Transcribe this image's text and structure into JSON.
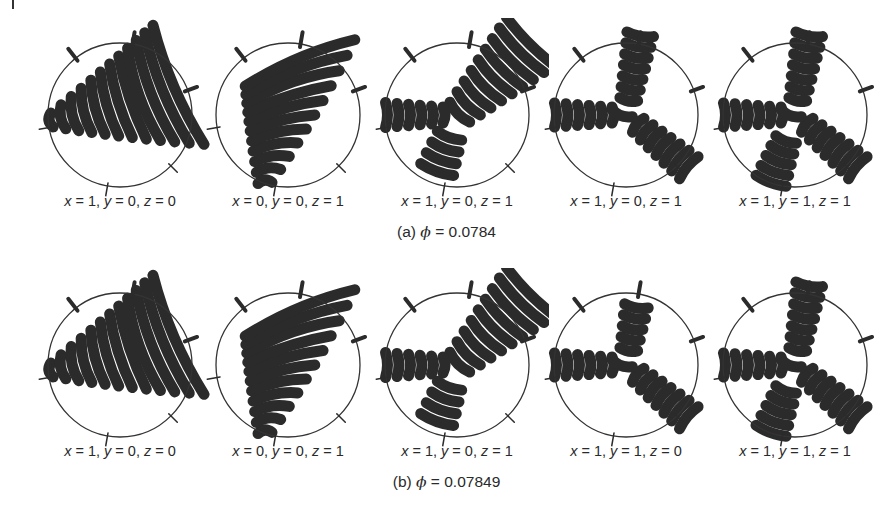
{
  "figure": {
    "rows": [
      {
        "caption_prefix": "(a)",
        "caption_symbol": "ϕ",
        "caption_value": "= 0.0784",
        "panels": [
          {
            "label": "x = 1, y = 0, z = 0",
            "pattern": "single-arm-right",
            "x_val": "1",
            "y_val": "0",
            "z_val": "0"
          },
          {
            "label": "x = 0, y = 0, z = 1",
            "pattern": "single-arm-down",
            "x_val": "0",
            "y_val": "0",
            "z_val": "1"
          },
          {
            "label": "x = 1, y = 0, z = 1",
            "pattern": "two-arm-diagonal",
            "x_val": "1",
            "y_val": "0",
            "z_val": "1"
          },
          {
            "label": "x = 1, y = 0, z = 1",
            "pattern": "three-arm",
            "x_val": "1",
            "y_val": "0",
            "z_val": "1"
          },
          {
            "label": "x = 1, y = 1, z = 1",
            "pattern": "three-arm-full",
            "x_val": "1",
            "y_val": "1",
            "z_val": "1"
          }
        ]
      },
      {
        "caption_prefix": "(b)",
        "caption_symbol": "ϕ",
        "caption_value": "= 0.07849",
        "panels": [
          {
            "label": "x = 1, y = 0, z = 0",
            "pattern": "single-arm-right",
            "x_val": "1",
            "y_val": "0",
            "z_val": "0"
          },
          {
            "label": "x = 0, y = 0, z = 1",
            "pattern": "single-arm-down",
            "x_val": "0",
            "y_val": "0",
            "z_val": "1"
          },
          {
            "label": "x = 1, y = 0, z = 1",
            "pattern": "two-arm-diagonal",
            "x_val": "1",
            "y_val": "0",
            "z_val": "1"
          },
          {
            "label": "x = 1, y = 1, z = 0",
            "pattern": "three-arm-short",
            "x_val": "1",
            "y_val": "1",
            "z_val": "0"
          },
          {
            "label": "x = 1, y = 1, z = 1",
            "pattern": "three-arm-full",
            "x_val": "1",
            "y_val": "1",
            "z_val": "1"
          }
        ]
      }
    ],
    "colors": {
      "ink": "#2b2b2b",
      "circle": "#333333",
      "background": "#ffffff"
    }
  }
}
